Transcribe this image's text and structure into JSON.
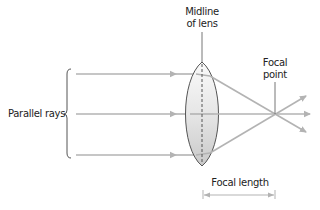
{
  "diagram": {
    "labels": {
      "midline": "Midline of lens",
      "midline_line1": "Midline",
      "midline_line2": "of lens",
      "focal_point_line1": "Focal",
      "focal_point_line2": "point",
      "parallel_rays": "Parallel rays",
      "focal_length": "Focal length"
    },
    "colors": {
      "ray": "#b3b3b3",
      "outline": "#555555",
      "lens_fill_light": "#f7f7f7",
      "lens_fill_dark": "#cfcfcf",
      "text": "#222222"
    },
    "rays": [
      {
        "name": "top-ray",
        "y": 74
      },
      {
        "name": "middle-ray",
        "y": 114
      },
      {
        "name": "bottom-ray",
        "y": 155
      }
    ],
    "lens": {
      "center_x": 202,
      "top_y": 62,
      "bottom_y": 166
    },
    "focal_point": {
      "x": 275,
      "y": 114
    }
  }
}
